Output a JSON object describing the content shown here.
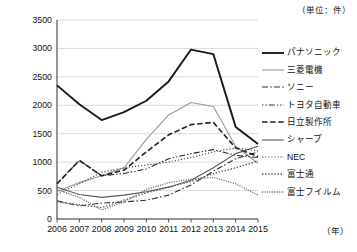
{
  "unit_note": "（単位：件）",
  "x_unit": "（年）",
  "chart_data": {
    "type": "line",
    "title": "",
    "subtitle": "",
    "xlabel": "（年）",
    "ylabel": "（単位：件）",
    "grid": true,
    "legend_position": "right",
    "xlim": [
      2006,
      2015
    ],
    "ylim": [
      0,
      3500
    ],
    "yticks": [
      0,
      500,
      1000,
      1500,
      2000,
      2500,
      3000,
      3500
    ],
    "categories": [
      "2006",
      "2007",
      "2008",
      "2009",
      "2010",
      "2011",
      "2012",
      "2013",
      "2014",
      "2015"
    ],
    "x": [
      2006,
      2007,
      2008,
      2009,
      2010,
      2011,
      2012,
      2013,
      2014,
      2015
    ],
    "series": [
      {
        "name": "パナソニック",
        "style": "solid-thick-black",
        "color": "#1a1a1a",
        "values": [
          2350,
          2020,
          1740,
          1880,
          2080,
          2420,
          2980,
          2900,
          1620,
          1320
        ]
      },
      {
        "name": "三菱電機",
        "style": "solid-thin-gray",
        "color": "#9a9a9a",
        "values": [
          480,
          640,
          760,
          900,
          1400,
          1830,
          2050,
          1980,
          1280,
          980
        ]
      },
      {
        "name": "ソニー",
        "style": "dash-dot",
        "color": "#333333",
        "values": [
          320,
          230,
          280,
          300,
          330,
          420,
          600,
          840,
          1060,
          1180
        ]
      },
      {
        "name": "トヨタ自動車",
        "style": "long-dash",
        "color": "#2a2a2a",
        "values": [
          620,
          1030,
          760,
          800,
          880,
          1060,
          1150,
          1220,
          1120,
          1080
        ]
      },
      {
        "name": "日立製作所",
        "style": "dashed-bold",
        "color": "#222222",
        "values": [
          620,
          1030,
          760,
          860,
          1180,
          1480,
          1660,
          1700,
          1250,
          1100
        ]
      },
      {
        "name": "シャープ",
        "style": "solid-thin-dark",
        "color": "#595959",
        "values": [
          560,
          430,
          380,
          420,
          480,
          560,
          680,
          900,
          1150,
          1280
        ]
      },
      {
        "name": "NEC",
        "style": "dotted-fine",
        "color": "#4a4a4a",
        "values": [
          430,
          620,
          820,
          900,
          950,
          1000,
          1080,
          1180,
          1250,
          1200
        ]
      },
      {
        "name": "富士通",
        "style": "dotted-medium",
        "color": "#555555",
        "values": [
          300,
          250,
          200,
          330,
          460,
          560,
          660,
          800,
          900,
          1020
        ]
      },
      {
        "name": "富士フイルム",
        "style": "dotted-dense",
        "color": "#6a6a6a",
        "values": [
          520,
          380,
          160,
          300,
          520,
          640,
          700,
          730,
          620,
          420
        ]
      }
    ]
  }
}
